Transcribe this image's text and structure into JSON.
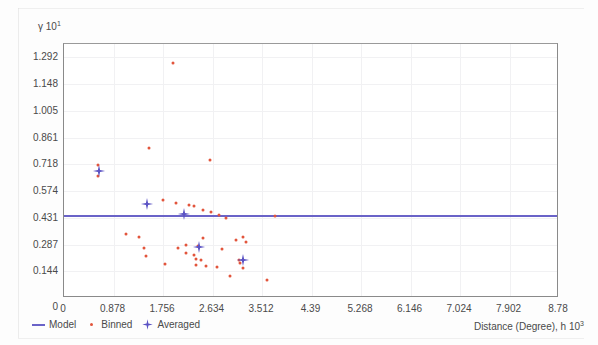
{
  "chart_data": {
    "type": "scatter",
    "title": "",
    "xlabel": "Distance (Degree), h  10",
    "xlabel_exponent": "3",
    "ylabel": "γ  10",
    "ylabel_exponent": "1",
    "xlim": [
      0,
      8.78
    ],
    "ylim": [
      0,
      1.3638
    ],
    "grid": true,
    "legend_position": "below-left",
    "xticks": [
      "0",
      "0.878",
      "1.756",
      "2.634",
      "3.512",
      "4.39",
      "5.268",
      "6.146",
      "7.024",
      "7.902",
      "8.78"
    ],
    "xtick_values": [
      0,
      0.878,
      1.756,
      2.634,
      3.512,
      4.39,
      5.268,
      6.146,
      7.024,
      7.902,
      8.78
    ],
    "yticks": [
      "0",
      "0.144",
      "0.287",
      "0.431",
      "0.574",
      "0.718",
      "0.861",
      "1.005",
      "1.148",
      "1.292"
    ],
    "ytick_values": [
      0,
      0.144,
      0.287,
      0.431,
      0.574,
      0.718,
      0.861,
      1.005,
      1.148,
      1.292
    ],
    "series": [
      {
        "name": "Model",
        "type": "line",
        "color": "#6a63c8",
        "constant_value": 0.447,
        "x": [
          0,
          8.78
        ],
        "values": [
          0.447,
          0.447
        ]
      },
      {
        "name": "Binned",
        "type": "scatter",
        "color": "#e2553c",
        "points": [
          [
            1.93,
            1.264
          ],
          [
            1.51,
            0.805
          ],
          [
            2.59,
            0.742
          ],
          [
            0.6,
            0.712
          ],
          [
            0.6,
            0.655
          ],
          [
            1.75,
            0.527
          ],
          [
            1.99,
            0.508
          ],
          [
            2.22,
            0.498
          ],
          [
            2.3,
            0.494
          ],
          [
            2.46,
            0.47
          ],
          [
            2.61,
            0.462
          ],
          [
            2.75,
            0.447
          ],
          [
            3.75,
            0.44
          ],
          [
            2.87,
            0.428
          ],
          [
            1.1,
            0.345
          ],
          [
            1.33,
            0.33
          ],
          [
            2.46,
            0.32
          ],
          [
            3.05,
            0.312
          ],
          [
            2.17,
            0.287
          ],
          [
            2.38,
            0.281
          ],
          [
            1.42,
            0.27
          ],
          [
            2.02,
            0.266
          ],
          [
            2.8,
            0.262
          ],
          [
            3.18,
            0.33
          ],
          [
            3.22,
            0.3
          ],
          [
            2.17,
            0.243
          ],
          [
            2.3,
            0.23
          ],
          [
            1.45,
            0.225
          ],
          [
            2.34,
            0.212
          ],
          [
            2.43,
            0.205
          ],
          [
            3.1,
            0.206
          ],
          [
            3.13,
            0.19
          ],
          [
            1.8,
            0.18
          ],
          [
            2.34,
            0.175
          ],
          [
            2.51,
            0.17
          ],
          [
            2.72,
            0.165
          ],
          [
            3.18,
            0.163
          ],
          [
            2.95,
            0.12
          ],
          [
            3.6,
            0.095
          ]
        ]
      },
      {
        "name": "Averaged",
        "type": "scatter",
        "color": "#5b53c4",
        "points": [
          [
            0.62,
            0.683
          ],
          [
            1.48,
            0.505
          ],
          [
            2.12,
            0.452
          ],
          [
            2.4,
            0.272
          ],
          [
            3.18,
            0.205
          ]
        ]
      }
    ]
  },
  "legend": {
    "items": [
      {
        "label": "Model",
        "marker": "line-swatch",
        "color": "#6a63c8"
      },
      {
        "label": "Binned",
        "marker": "dot-swatch",
        "color": "#e2553c"
      },
      {
        "label": "Averaged",
        "marker": "cross-swatch",
        "color": "#5b53c4"
      }
    ]
  }
}
